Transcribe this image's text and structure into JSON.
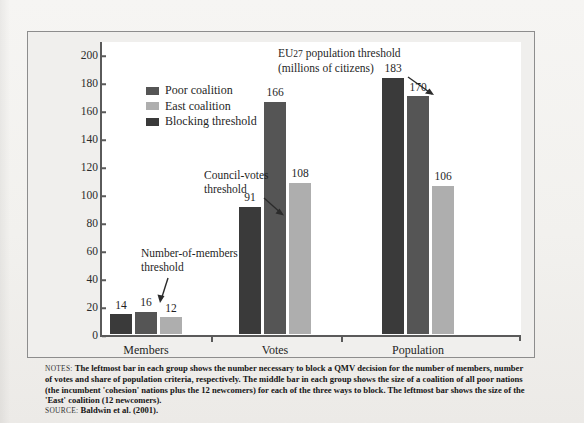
{
  "chart_data": {
    "type": "bar",
    "title": "",
    "xlabel": "",
    "ylabel": "",
    "ylim": [
      0,
      210
    ],
    "yticks": [
      0,
      20,
      40,
      60,
      80,
      100,
      120,
      140,
      160,
      180,
      200
    ],
    "grid": false,
    "legend_position": "upper-left-inside",
    "categories": [
      "Members",
      "Votes",
      "Population"
    ],
    "series": [
      {
        "name": "Blocking threshold",
        "color": "#3a3a3a",
        "values": [
          14,
          166,
          183
        ]
      },
      {
        "name": "Poor coalition",
        "color": "#555555",
        "values": [
          16,
          108,
          170
        ]
      },
      {
        "name": "East coalition",
        "color": "#aeaeae",
        "values": [
          12,
          108,
          106
        ]
      }
    ],
    "bar_order_in_group": [
      "Blocking threshold",
      "Poor coalition",
      "East coalition"
    ],
    "bars": [
      {
        "group": "Members",
        "series": "Blocking threshold",
        "value": 14,
        "label": "14"
      },
      {
        "group": "Members",
        "series": "Poor coalition",
        "value": 16,
        "label": "16"
      },
      {
        "group": "Members",
        "series": "East coalition",
        "value": 12,
        "label": "12"
      },
      {
        "group": "Votes",
        "series": "Blocking threshold",
        "value": 91,
        "label": "91"
      },
      {
        "group": "Votes",
        "series": "Poor coalition",
        "value": 166,
        "label": "166"
      },
      {
        "group": "Votes",
        "series": "East coalition",
        "value": 108,
        "label": "108"
      },
      {
        "group": "Population",
        "series": "Blocking threshold",
        "value": 183,
        "label": "183"
      },
      {
        "group": "Population",
        "series": "Poor coalition",
        "value": 170,
        "label": "170"
      },
      {
        "group": "Population",
        "series": "East coalition",
        "value": 106,
        "label": "106"
      }
    ],
    "annotations": [
      {
        "id": "eu27",
        "line1": "EU27 population threshold",
        "line2": "(millions of citizens)"
      },
      {
        "id": "council",
        "line1": "Council-votes",
        "line2": "threshold"
      },
      {
        "id": "members",
        "line1": "Number-of-members",
        "line2": "threshold"
      }
    ]
  },
  "legend": {
    "items": [
      {
        "label": "Poor coalition",
        "color": "#555555"
      },
      {
        "label": "East coalition",
        "color": "#aeaeae"
      },
      {
        "label": "Blocking threshold",
        "color": "#3a3a3a"
      }
    ]
  },
  "axes": {
    "yticks": [
      "200",
      "180",
      "160",
      "140",
      "120",
      "100",
      "80",
      "60",
      "40",
      "20",
      "0"
    ],
    "xcategories": [
      "Members",
      "Votes",
      "Population"
    ]
  },
  "annotations": {
    "eu27_line1": "EU27 population threshold",
    "eu27_line2": "(millions of citizens)",
    "eu27_prefix": "EU",
    "eu27_smallcaps": "27",
    "eu27_rest": " population threshold",
    "council_line1": "Council-votes",
    "council_line2": "threshold",
    "members_line1": "Number-of-members",
    "members_line2": "threshold"
  },
  "notes": {
    "label": "NOTES:",
    "text": "The leftmost bar in each group shows the number necessary to block a QMV decision for the number of members, number of votes and share of population criteria, respectively. The middle bar in each group shows the size of a coalition of all poor nations (the incumbent 'cohesion' nations plus the 12 newcomers) for each of the three ways to block. The leftmost bar shows the size of the 'East' coalition (12 newcomers)."
  },
  "source": {
    "label": "SOURCE:",
    "text": "Baldwin et al. (2001)."
  },
  "colors": {
    "blocking_threshold": "#3a3a3a",
    "poor_coalition": "#555555",
    "east_coalition": "#aeaeae",
    "axis": "#5a5a5a",
    "figure_bg": "#f0efed",
    "plot_bg": "#ffffff"
  }
}
